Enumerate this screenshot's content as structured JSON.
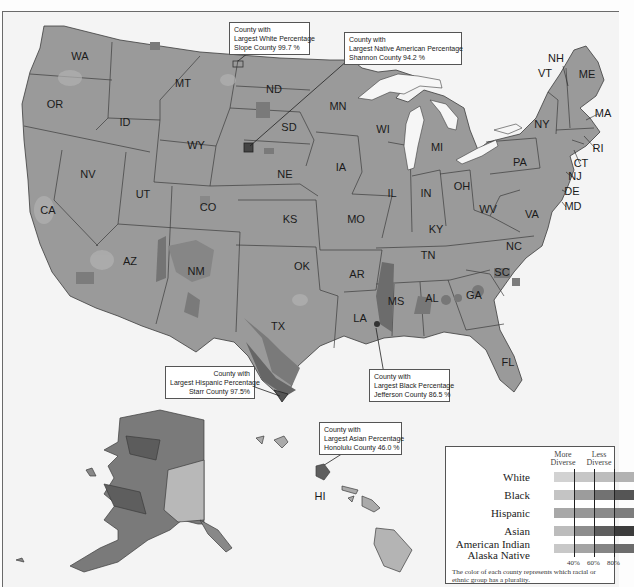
{
  "map": {
    "subject": "U.S. counties colored by racial/ethnic plurality group",
    "colors": {
      "background": "#f4f4f4",
      "state_fill": "#9a9a9a",
      "state_border": "#3c3c3c",
      "white_light": "#b4b4b4",
      "black_dark": "#5e5e5e",
      "hispanic_mid": "#7f7f7f",
      "native_dark": "#6a6a6a",
      "water": "#f6f6f6"
    },
    "state_labels": [
      {
        "abbr": "WA",
        "x": 80,
        "y": 60
      },
      {
        "abbr": "OR",
        "x": 55,
        "y": 108
      },
      {
        "abbr": "ID",
        "x": 125,
        "y": 126
      },
      {
        "abbr": "MT",
        "x": 183,
        "y": 87
      },
      {
        "abbr": "WY",
        "x": 196,
        "y": 149
      },
      {
        "abbr": "ND",
        "x": 274,
        "y": 93
      },
      {
        "abbr": "SD",
        "x": 289,
        "y": 131
      },
      {
        "abbr": "NE",
        "x": 285,
        "y": 178
      },
      {
        "abbr": "MN",
        "x": 338,
        "y": 110
      },
      {
        "abbr": "IA",
        "x": 341,
        "y": 171
      },
      {
        "abbr": "WI",
        "x": 383,
        "y": 133
      },
      {
        "abbr": "MI",
        "x": 437,
        "y": 151
      },
      {
        "abbr": "IL",
        "x": 392,
        "y": 197
      },
      {
        "abbr": "IN",
        "x": 426,
        "y": 197
      },
      {
        "abbr": "OH",
        "x": 462,
        "y": 190
      },
      {
        "abbr": "PA",
        "x": 520,
        "y": 166
      },
      {
        "abbr": "NY",
        "x": 542,
        "y": 128
      },
      {
        "abbr": "NV",
        "x": 88,
        "y": 178
      },
      {
        "abbr": "UT",
        "x": 143,
        "y": 198
      },
      {
        "abbr": "CO",
        "x": 208,
        "y": 211
      },
      {
        "abbr": "CA",
        "x": 48,
        "y": 214
      },
      {
        "abbr": "KS",
        "x": 290,
        "y": 223
      },
      {
        "abbr": "MO",
        "x": 356,
        "y": 223
      },
      {
        "abbr": "KY",
        "x": 436,
        "y": 233
      },
      {
        "abbr": "WV",
        "x": 488,
        "y": 213
      },
      {
        "abbr": "VA",
        "x": 532,
        "y": 218
      },
      {
        "abbr": "AZ",
        "x": 130,
        "y": 265
      },
      {
        "abbr": "NM",
        "x": 196,
        "y": 275
      },
      {
        "abbr": "OK",
        "x": 302,
        "y": 270
      },
      {
        "abbr": "AR",
        "x": 357,
        "y": 278
      },
      {
        "abbr": "TN",
        "x": 428,
        "y": 259
      },
      {
        "abbr": "NC",
        "x": 514,
        "y": 250
      },
      {
        "abbr": "SC",
        "x": 502,
        "y": 276
      },
      {
        "abbr": "GA",
        "x": 474,
        "y": 299
      },
      {
        "abbr": "AL",
        "x": 432,
        "y": 302
      },
      {
        "abbr": "MS",
        "x": 396,
        "y": 305
      },
      {
        "abbr": "LA",
        "x": 360,
        "y": 322
      },
      {
        "abbr": "TX",
        "x": 278,
        "y": 330
      },
      {
        "abbr": "FL",
        "x": 508,
        "y": 366
      },
      {
        "abbr": "NH",
        "x": 556,
        "y": 62
      },
      {
        "abbr": "VT",
        "x": 545,
        "y": 77
      },
      {
        "abbr": "ME",
        "x": 587,
        "y": 78
      },
      {
        "abbr": "MA",
        "x": 603,
        "y": 117
      },
      {
        "abbr": "RI",
        "x": 598,
        "y": 152
      },
      {
        "abbr": "CT",
        "x": 581,
        "y": 167
      },
      {
        "abbr": "NJ",
        "x": 575,
        "y": 180
      },
      {
        "abbr": "DE",
        "x": 572,
        "y": 195
      },
      {
        "abbr": "MD",
        "x": 573,
        "y": 210
      },
      {
        "abbr": "HI",
        "x": 320,
        "y": 500
      }
    ],
    "callouts": [
      {
        "id": "white",
        "line1": "County with",
        "line2": "Largest White Percentage",
        "line3": "Slope County  99.7 %",
        "align": "left"
      },
      {
        "id": "native",
        "line1": "County with",
        "line2": "Largest Native American Percentage",
        "line3": "Shannon County  94.2 %",
        "align": "left"
      },
      {
        "id": "hispanic",
        "line1": "County with",
        "line2": "Largest Hispanic Percentage",
        "line3": "Starr County  97.5%",
        "align": "right"
      },
      {
        "id": "black",
        "line1": "County with",
        "line2": "Largest Black Percentage",
        "line3": "Jefferson County  86.5 %",
        "align": "left"
      },
      {
        "id": "asian",
        "line1": "County with",
        "line2": "Largest Asian Percentage",
        "line3": "Honolulu County  46.0 %",
        "align": "left"
      }
    ]
  },
  "legend": {
    "header_left": "More\nDiverse",
    "header_left_1": "More",
    "header_left_2": "Diverse",
    "header_right_1": "Less",
    "header_right_2": "Diverse",
    "rows": [
      {
        "label": "White",
        "shades": [
          "#d2d2d2",
          "#c6c6c6",
          "#bdbdbd",
          "#b2b2b2"
        ]
      },
      {
        "label": "Black",
        "shades": [
          "#c4c4c4",
          "#9c9c9c",
          "#727272",
          "#555555"
        ]
      },
      {
        "label": "Hispanic",
        "shades": [
          "#a8a8a8",
          "#979797",
          "#8a8a8a",
          "#7d7d7d"
        ]
      },
      {
        "label": "Asian",
        "shades": [
          "#bcbcbc",
          "#8d8d8d",
          "#5e5e5e",
          "#3c3c3c"
        ]
      },
      {
        "label_1": "American Indian",
        "label_2": "Alaska Native",
        "shades": [
          "#c8c8c8",
          "#a4a4a4",
          "#858585",
          "#6c6c6c"
        ]
      }
    ],
    "ticks": [
      "40%",
      "60%",
      "80%"
    ],
    "note": "The color of each county represents which racial or ethnic group has a plurality."
  }
}
